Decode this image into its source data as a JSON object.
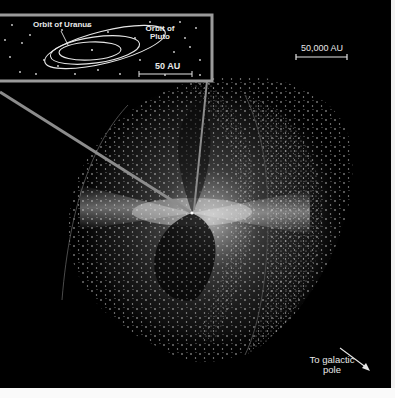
{
  "figure": {
    "background_color": "#000000",
    "line_color": "#9a9a9a",
    "dot_color": "#ffffff"
  },
  "inset": {
    "labels": {
      "uranus_orbit": "Orbit of Uranus",
      "pluto_orbit_line1": "Orbit of",
      "pluto_orbit_line2": "Pluto",
      "scale": "50 AU"
    }
  },
  "main": {
    "scale_label": "50,000 AU",
    "direction_label_line1": "To galactic",
    "direction_label_line2": "pole"
  }
}
